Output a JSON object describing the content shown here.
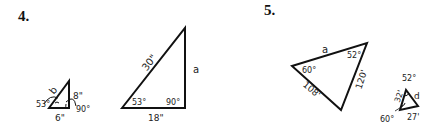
{
  "problems": [
    {
      "number": "4.",
      "small_triangle": {
        "side_hyp": "b",
        "side_vertical": "8\"",
        "side_base": "6\"",
        "angle_left": "53°",
        "angle_right": "90°"
      },
      "large_triangle": {
        "side_hyp": "30\"",
        "side_vertical": "a",
        "side_base": "18\"",
        "angle_left": "53°",
        "angle_right": "90°"
      }
    },
    {
      "number": "5.",
      "large_triangle": {
        "side_top": "a",
        "side_left": "108'",
        "side_right": "120'",
        "angle_left": "60°",
        "angle_top": "52°"
      },
      "small_triangle": {
        "side_left": "32'",
        "side_right": "d",
        "side_base": "27'",
        "angle_top": "52°",
        "angle_bottom": "60°"
      }
    }
  ]
}
